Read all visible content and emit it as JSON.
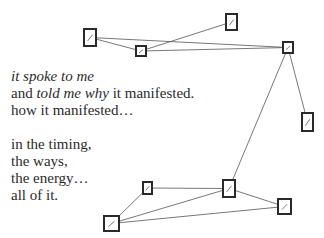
{
  "poem": {
    "stanza1": [
      {
        "parts": [
          {
            "text": "it spoke to me",
            "italic": true
          }
        ]
      },
      {
        "parts": [
          {
            "text": "and ",
            "italic": false
          },
          {
            "text": "told me why",
            "italic": true
          },
          {
            "text": " it manifested.",
            "italic": false
          }
        ]
      },
      {
        "parts": [
          {
            "text": "how it manifested…",
            "italic": false
          }
        ]
      }
    ],
    "stanza2": [
      {
        "parts": [
          {
            "text": "in the timing,",
            "italic": false
          }
        ]
      },
      {
        "parts": [
          {
            "text": "the ways,",
            "italic": false
          }
        ]
      },
      {
        "parts": [
          {
            "text": "the energy…",
            "italic": false
          }
        ]
      },
      {
        "parts": [
          {
            "text": "all of it.",
            "italic": false
          }
        ]
      }
    ]
  },
  "network": {
    "nodes": [
      "n1",
      "n2",
      "n3",
      "n4",
      "n5",
      "n6",
      "n7",
      "n8",
      "n9"
    ],
    "edges": [
      [
        "n1",
        "n2"
      ],
      [
        "n1",
        "n4"
      ],
      [
        "n2",
        "n3"
      ],
      [
        "n2",
        "n4"
      ],
      [
        "n4",
        "n5"
      ],
      [
        "n4",
        "n6"
      ],
      [
        "n6",
        "n8"
      ],
      [
        "n6",
        "n9"
      ],
      [
        "n6",
        "n7"
      ],
      [
        "n8",
        "n9"
      ],
      [
        "n9",
        "n7"
      ]
    ],
    "colors": {
      "stroke": "#2a2a2a",
      "edge": "#555555"
    }
  }
}
